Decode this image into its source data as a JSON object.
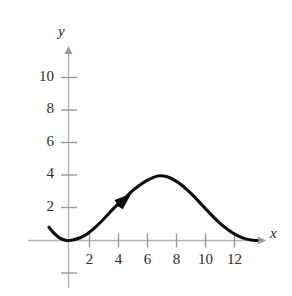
{
  "figure": {
    "name": "parametric-curve-graph",
    "background_color": "#ffffff",
    "curve_color": "#0d0d0d",
    "axis_color": "#b3b3b3",
    "text_color": "#2b2b2b"
  },
  "axes": {
    "x_label": "x",
    "y_label": "y",
    "x_ticks": [
      {
        "label": "2",
        "value": 2
      },
      {
        "label": "4",
        "value": 4
      },
      {
        "label": "6",
        "value": 6
      },
      {
        "label": "8",
        "value": 8
      },
      {
        "label": "10",
        "value": 10
      },
      {
        "label": "12",
        "value": 12
      }
    ],
    "y_ticks": [
      {
        "label": "2",
        "value": 2
      },
      {
        "label": "4",
        "value": 4
      },
      {
        "label": "6",
        "value": 6
      },
      {
        "label": "8",
        "value": 8
      },
      {
        "label": "10",
        "value": 10
      }
    ]
  },
  "chart_data": {
    "type": "line",
    "title": "",
    "subtitle": "",
    "xlabel": "x",
    "ylabel": "y",
    "xlim": [
      -1.5,
      13.5
    ],
    "ylim": [
      -2.5,
      11.5
    ],
    "grid": false,
    "legend": null,
    "annotations": [
      {
        "kind": "direction-arrowhead",
        "on_curve": true,
        "x": 3.9,
        "y": 2.55,
        "description": "solid arrowhead on curve pointing up and to the right, indicating direction of motion"
      },
      {
        "kind": "axis-arrowhead",
        "axis": "x",
        "description": "arrowhead at right end of x-axis"
      },
      {
        "kind": "axis-arrowhead",
        "axis": "y",
        "description": "arrowhead at top end of y-axis"
      }
    ],
    "series": [
      {
        "name": "curve",
        "color": "#0d0d0d",
        "x": [
          -1.35,
          -1.0,
          -0.6,
          -0.2,
          0.0,
          0.3,
          0.8,
          1.3,
          1.8,
          2.3,
          2.8,
          3.3,
          3.9,
          4.4,
          4.9,
          5.4,
          5.9,
          6.3,
          6.8,
          7.3,
          7.8,
          8.3,
          8.8,
          9.3,
          9.8,
          10.3,
          10.8,
          11.3,
          11.8,
          12.2,
          12.6,
          13.0
        ],
        "y": [
          0.82,
          0.45,
          0.15,
          0.01,
          0.0,
          0.03,
          0.17,
          0.42,
          0.78,
          1.2,
          1.68,
          2.15,
          2.62,
          3.05,
          3.4,
          3.68,
          3.9,
          3.98,
          3.92,
          3.72,
          3.42,
          3.02,
          2.58,
          2.1,
          1.62,
          1.18,
          0.8,
          0.48,
          0.24,
          0.1,
          0.03,
          0.0
        ]
      }
    ]
  }
}
